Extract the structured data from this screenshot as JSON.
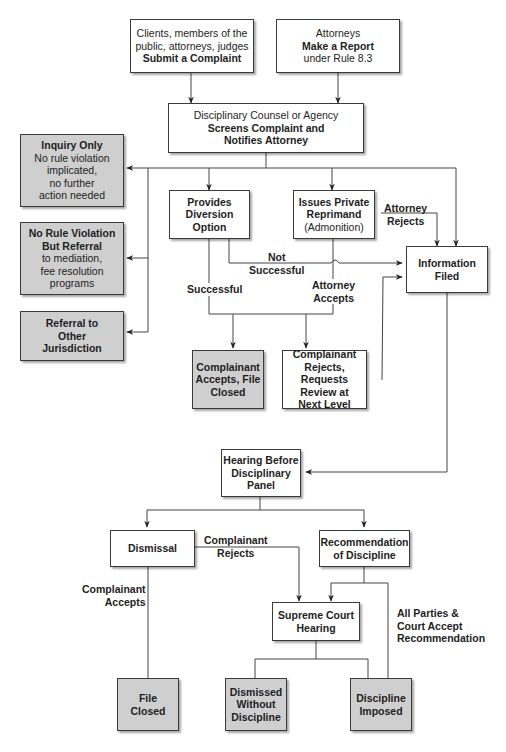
{
  "title_fragment": "",
  "colors": {
    "box_fill": "#ffffff",
    "terminal_fill": "#cfcfcf",
    "line": "#444444",
    "border": "#3a3a3a"
  },
  "nodes": {
    "submit_complaint": {
      "line1": "Clients, members of the",
      "line2": "public, attorneys, judges",
      "bold": "Submit a Complaint"
    },
    "make_report": {
      "line1": "Attorneys",
      "bold": "Make a Report",
      "line3": "under Rule 8.3"
    },
    "screens": {
      "line1": "Disciplinary Counsel or Agency",
      "bold1": "Screens Complaint and",
      "bold2": "Notifies Attorney"
    },
    "inquiry_only": {
      "bold": "Inquiry Only",
      "line2": "No rule violation",
      "line3": "implicated,",
      "line4": "no further",
      "line5": "action needed"
    },
    "no_violation_referral": {
      "bold1": "No Rule Violation",
      "bold2": "But Referral",
      "line3": "to mediation,",
      "line4": "fee resolution",
      "line5": "programs"
    },
    "referral_other": {
      "bold1": "Referral to",
      "bold2": "Other",
      "bold3": "Jurisdiction"
    },
    "diversion": {
      "bold1": "Provides",
      "bold2": "Diversion",
      "bold3": "Option"
    },
    "reprimand": {
      "bold1": "Issues Private",
      "bold2": "Reprimand",
      "line3": "(Admonition)"
    },
    "information_filed": {
      "bold1": "Information",
      "bold2": "Filed"
    },
    "complainant_accepts_closed": {
      "bold1": "Complainant",
      "bold2": "Accepts, File",
      "bold3": "Closed"
    },
    "complainant_rejects_review": {
      "bold1": "Complainant",
      "bold2": "Rejects, Requests",
      "bold3": "Review at",
      "bold4": "Next Level"
    },
    "hearing_panel": {
      "bold1": "Hearing Before",
      "bold2": "Disciplinary",
      "bold3": "Panel"
    },
    "dismissal": {
      "bold": "Dismissal"
    },
    "recommendation": {
      "bold1": "Recommendation",
      "bold2": "of Discipline"
    },
    "supreme_court": {
      "bold1": "Supreme Court",
      "bold2": "Hearing"
    },
    "file_closed": {
      "bold1": "File",
      "bold2": "Closed"
    },
    "dismissed_without": {
      "bold1": "Dismissed",
      "bold2": "Without",
      "bold3": "Discipline"
    },
    "discipline_imposed": {
      "bold1": "Discipline",
      "bold2": "Imposed"
    }
  },
  "edge_labels": {
    "attorney_rejects": {
      "l1": "Attorney",
      "l2": "Rejects"
    },
    "not_successful": {
      "l1": "Not",
      "l2": "Successful"
    },
    "successful": {
      "l1": "Successful"
    },
    "attorney_accepts": {
      "l1": "Attorney",
      "l2": "Accepts"
    },
    "complainant_rejects": {
      "l1": "Complainant",
      "l2": "Rejects"
    },
    "complainant_accepts": {
      "l1": "Complainant",
      "l2": "Accepts"
    },
    "all_parties": {
      "l1": "All Parties &",
      "l2": "Court Accept",
      "l3": "Recommendation"
    }
  }
}
